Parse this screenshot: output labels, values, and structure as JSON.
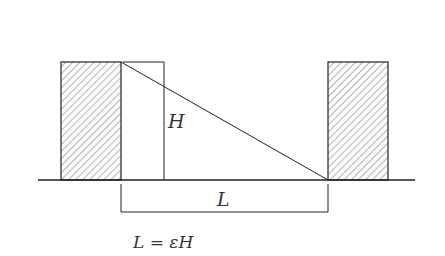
{
  "diagram": {
    "labels": {
      "height": "H",
      "length": "L",
      "formula": "L = εH"
    },
    "colors": {
      "stroke": "#222222",
      "hatch": "#555555",
      "background": "#ffffff"
    },
    "elements": {
      "left_block": {
        "x": 61,
        "y": 62,
        "width": 60,
        "height": 118
      },
      "right_block": {
        "x": 328,
        "y": 62,
        "width": 60,
        "height": 118
      },
      "ground_y": 180,
      "height_marker_x": 164,
      "diagonal": {
        "x1": 121,
        "y1": 62,
        "x2": 328,
        "y2": 180
      }
    }
  }
}
